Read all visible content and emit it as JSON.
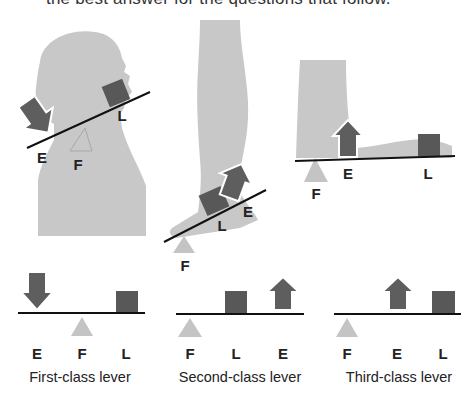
{
  "intro_text": "the best answer for the questions that follow.",
  "colors": {
    "body_silhouette": "#c8c8c8",
    "effort_arrow": "#5e5e5e",
    "load_box": "#585858",
    "fulcrum": "#c4c4c4",
    "lever_bar": "#111111"
  },
  "examples": [
    {
      "name": "head-neck",
      "labels": {
        "effort": "E",
        "fulcrum": "F",
        "load": "L"
      }
    },
    {
      "name": "foot-calf",
      "labels": {
        "effort": "E",
        "fulcrum": "F",
        "load": "L"
      }
    },
    {
      "name": "forearm",
      "labels": {
        "effort": "E",
        "fulcrum": "F",
        "load": "L"
      }
    }
  ],
  "diagrams": [
    {
      "caption": "First-class lever",
      "order": [
        "E",
        "F",
        "L"
      ]
    },
    {
      "caption": "Second-class lever",
      "order": [
        "F",
        "L",
        "E"
      ]
    },
    {
      "caption": "Third-class lever",
      "order": [
        "F",
        "E",
        "L"
      ]
    }
  ]
}
